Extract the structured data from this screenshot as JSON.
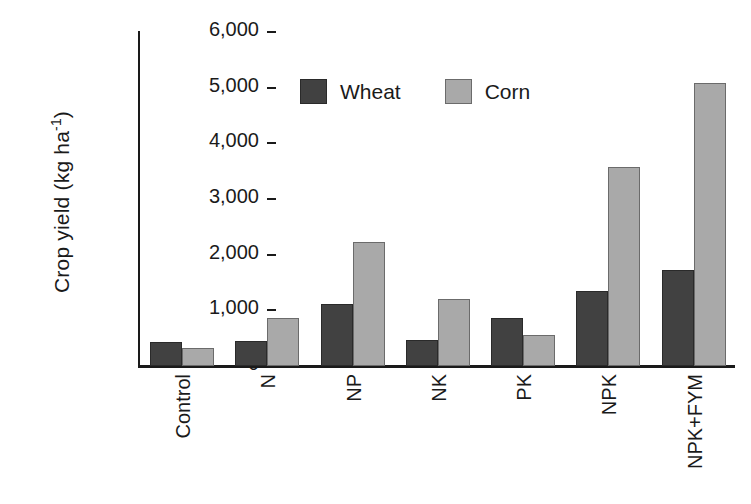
{
  "chart_data": {
    "type": "bar",
    "title": "",
    "xlabel": "",
    "ylabel": "Crop yield (kg ha-1)",
    "ylabel_base": "Crop yield (kg ha",
    "ylabel_exponent": "-1",
    "ylabel_close": ")",
    "categories": [
      "Control",
      "N",
      "NP",
      "NK",
      "PK",
      "NPK",
      "NPK+FYM"
    ],
    "series": [
      {
        "name": "Wheat",
        "color": "#414141",
        "values": [
          430,
          450,
          1120,
          460,
          860,
          1340,
          1720
        ]
      },
      {
        "name": "Corn",
        "color": "#a9a9a9",
        "values": [
          320,
          860,
          2230,
          1210,
          560,
          3570,
          5080
        ]
      }
    ],
    "ylim": [
      0,
      6000
    ],
    "ytick_values": [
      0,
      1000,
      2000,
      3000,
      4000,
      5000,
      6000
    ],
    "ytick_labels": [
      "0",
      "1,000",
      "2,000",
      "3,000",
      "4,000",
      "5,000",
      "6,000"
    ],
    "grid": false,
    "legend_position": "top-center",
    "legend": [
      "Wheat",
      "Corn"
    ]
  }
}
